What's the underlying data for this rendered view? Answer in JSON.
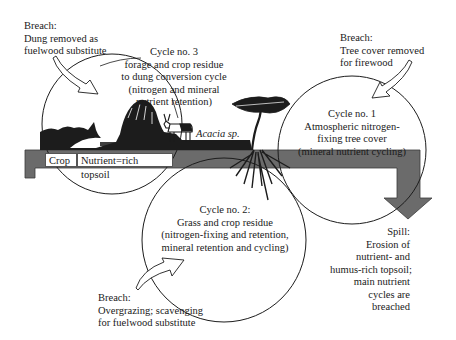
{
  "diagram": {
    "type": "nutrient-cycle diagram",
    "colors": {
      "band": "#6b6b6b",
      "ink": "#1a1a1a",
      "background": "#ffffff"
    },
    "band_labels": {
      "crop": "Crop",
      "topsoil": "Nutrient=rich topsoil"
    },
    "species_label": "Acacia sp.",
    "cycles": {
      "cycle3": {
        "title": "Cycle no. 3",
        "lines": [
          "forage and crop residue",
          "to dung conversion cycle",
          "(nitrogen and mineral",
          "nutrient retention)"
        ]
      },
      "cycle1": {
        "title": "Cycle no. 1",
        "lines": [
          "Atmospheric nitrogen-",
          "fixing tree cover",
          "(mineral nutrient cycling)"
        ]
      },
      "cycle2": {
        "title": "Cycle no. 2:",
        "lines": [
          "Grass and crop residue",
          "(nitrogen-fixing and retention,",
          "mineral retention and cycling)"
        ]
      }
    },
    "breaches": {
      "dung": {
        "title": "Breach:",
        "lines": [
          "Dung removed as",
          "fuelwood substitute"
        ]
      },
      "tree": {
        "title": "Breach:",
        "lines": [
          "Tree cover removed",
          "for firewood"
        ]
      },
      "grazing": {
        "title": "Breach:",
        "lines": [
          "Overgrazing; scavenging",
          "for fuelwood substitute"
        ]
      }
    },
    "spill": {
      "title": "Spill:",
      "lines": [
        "Erosion of",
        "nutrient- and",
        "humus-rich topsoil;",
        "main nutrient",
        "cycles are",
        "breached"
      ]
    }
  }
}
